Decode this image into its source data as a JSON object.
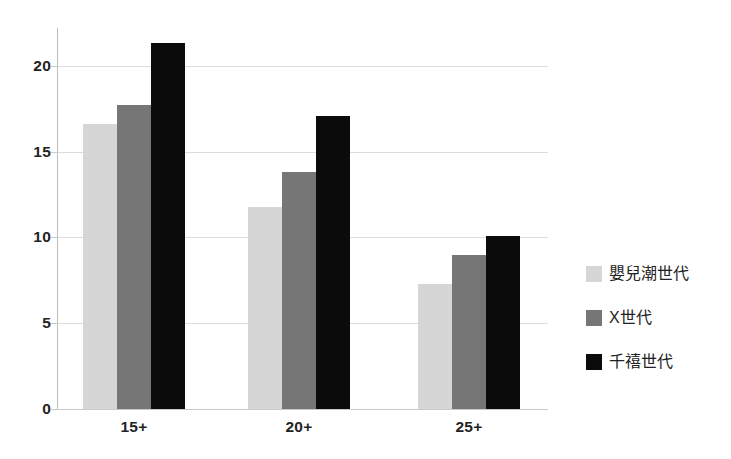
{
  "chart_data": {
    "type": "bar",
    "title": "",
    "subtitle": "",
    "xlabel": "",
    "ylabel": "",
    "categories": [
      "15+",
      "20+",
      "25+"
    ],
    "series": [
      {
        "name": "嬰兒潮世代",
        "color": "#d6d6d6",
        "values": [
          16.6,
          11.8,
          7.3
        ]
      },
      {
        "name": "X世代",
        "color": "#767676",
        "values": [
          17.7,
          13.8,
          9.0
        ]
      },
      {
        "name": "千禧世代",
        "color": "#0b0b0b",
        "values": [
          21.3,
          17.1,
          10.1
        ]
      }
    ],
    "ylim": [
      0,
      22.2
    ],
    "yticks": [
      0,
      5,
      10,
      15,
      20
    ],
    "ytick_labels": [
      "0",
      "5",
      "10",
      "15",
      "20"
    ],
    "grid": true,
    "grid_axis": "y",
    "legend_position": "right",
    "annotations": []
  },
  "legend": {
    "items": [
      {
        "label": "嬰兒潮世代"
      },
      {
        "label": "X世代"
      },
      {
        "label": "千禧世代"
      }
    ]
  }
}
